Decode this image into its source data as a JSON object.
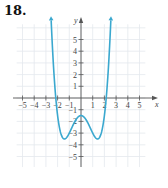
{
  "problem": {
    "number": "18."
  },
  "colors": {
    "curve": "#3aa8cf",
    "axis": "#555555",
    "grid": "#e4e9ee"
  },
  "chart_data": {
    "type": "line",
    "title": "",
    "xlabel": "x",
    "ylabel": "y",
    "xlim": [
      -5.5,
      5.5
    ],
    "ylim": [
      -5.9,
      6.3
    ],
    "grid": true,
    "x_ticks": [
      -5,
      -4,
      -3,
      -2,
      -1,
      1,
      2,
      3,
      4,
      5
    ],
    "y_ticks": [
      -5,
      -4,
      -3,
      -2,
      -1,
      1,
      2,
      3,
      4,
      5
    ],
    "x_tick_labels": [
      "−5",
      "−4",
      "−3",
      "−2",
      "−1",
      "1",
      "2",
      "3",
      "4",
      "5"
    ],
    "y_tick_labels": [
      "−5",
      "−4",
      "−3",
      "−2",
      "−1",
      "1",
      "2",
      "3",
      "4",
      "5"
    ],
    "series": [
      {
        "name": "f(x) ≈ 0.5x⁴ − 2x² − 1.5",
        "description": "Quartic W-shaped curve, arrows at both ends pointing upward",
        "x": [
          -2.55,
          -2.4,
          -2.2,
          -2.0,
          -1.8,
          -1.6,
          -1.414,
          -1.2,
          -1.0,
          -0.8,
          -0.6,
          -0.4,
          -0.2,
          0,
          0.2,
          0.4,
          0.6,
          0.8,
          1.0,
          1.2,
          1.414,
          1.6,
          1.8,
          2.0,
          2.2,
          2.4,
          2.55
        ],
        "y": [
          6.1,
          3.6,
          0.5,
          -1.5,
          -2.73,
          -3.34,
          -3.5,
          -3.34,
          -3.0,
          -2.57,
          -2.17,
          -1.81,
          -1.58,
          -1.5,
          -1.58,
          -1.81,
          -2.17,
          -2.57,
          -3.0,
          -3.34,
          -3.5,
          -3.34,
          -2.73,
          -1.5,
          0.5,
          3.6,
          6.1
        ],
        "key_points": {
          "local_max": [
            0,
            -1.5
          ],
          "local_mins": [
            [
              -1.4,
              -3.5
            ],
            [
              1.4,
              -3.5
            ]
          ],
          "x_intercepts": [
            -2.15,
            2.15
          ]
        }
      }
    ]
  }
}
